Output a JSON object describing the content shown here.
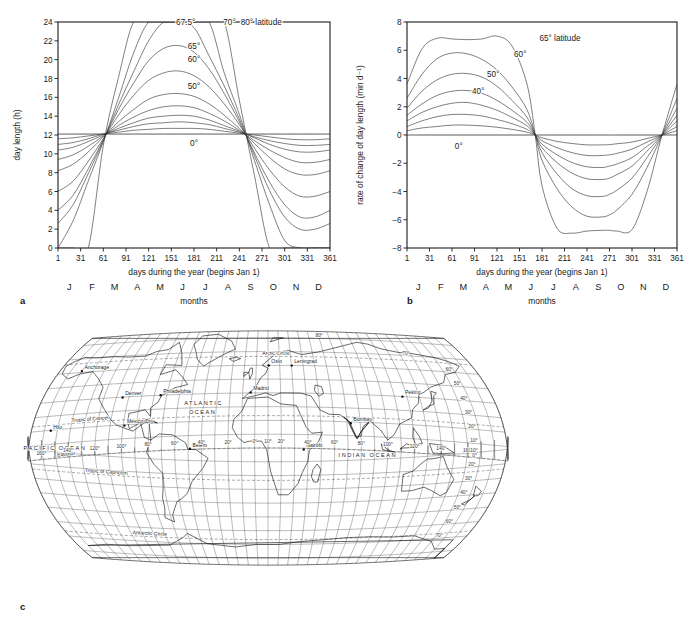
{
  "figure": {
    "panels": [
      {
        "letter": "a",
        "name": "day-length-chart"
      },
      {
        "letter": "b",
        "name": "rate-of-change-chart"
      },
      {
        "letter": "c",
        "name": "world-map"
      }
    ]
  },
  "panel_a": {
    "letter": "a",
    "ylabel": "day length (h)",
    "xlabel": "days during the year (begins Jan 1)",
    "months_label": "months",
    "yticks": [
      0,
      2,
      4,
      6,
      8,
      10,
      12,
      14,
      16,
      18,
      20,
      22,
      24
    ],
    "xticks": [
      1,
      31,
      61,
      91,
      121,
      151,
      181,
      211,
      241,
      271,
      301,
      331,
      361
    ],
    "months": [
      "J",
      "F",
      "M",
      "A",
      "M",
      "J",
      "J",
      "A",
      "S",
      "O",
      "N",
      "D"
    ],
    "curve_labels": [
      {
        "text": "67.5°",
        "x": 170,
        "y": 24
      },
      {
        "text": "70°",
        "x": 228,
        "y": 24
      },
      {
        "text": "80° latitude",
        "x": 270,
        "y": 24
      },
      {
        "text": "65°",
        "x": 181,
        "y": 21.5
      },
      {
        "text": "60°",
        "x": 181,
        "y": 20.1
      },
      {
        "text": "50°",
        "x": 181,
        "y": 17.2
      },
      {
        "text": "0°",
        "x": 181,
        "y": 11.15
      }
    ]
  },
  "panel_b": {
    "letter": "b",
    "ylabel": "rate of change of day length (min d⁻¹)",
    "xlabel": "days during the year (begins Jan 1)",
    "months_label": "months",
    "yticks": [
      -8,
      -6,
      -4,
      -2,
      0,
      2,
      4,
      6,
      8
    ],
    "xticks": [
      1,
      31,
      61,
      91,
      121,
      151,
      181,
      211,
      241,
      271,
      301,
      331,
      361
    ],
    "months": [
      "J",
      "F",
      "M",
      "A",
      "M",
      "J",
      "J",
      "A",
      "S",
      "O",
      "N",
      "D"
    ],
    "curve_labels": [
      {
        "text": "65° latitude",
        "x": 205,
        "y": 6.9
      },
      {
        "text": "60°",
        "x": 152,
        "y": 5.75
      },
      {
        "text": "50°",
        "x": 116,
        "y": 4.3
      },
      {
        "text": "40°",
        "x": 96,
        "y": 3.15
      },
      {
        "text": "0°",
        "x": 70,
        "y": -0.75
      }
    ]
  },
  "panel_c": {
    "letter": "c",
    "cities": [
      {
        "name": "Anchorage",
        "lon": -150,
        "lat": 61
      },
      {
        "name": "Denver",
        "lon": -105,
        "lat": 39.7
      },
      {
        "name": "Philadelphia",
        "lon": -75,
        "lat": 40
      },
      {
        "name": "Oslo",
        "lon": 10.7,
        "lat": 59.9
      },
      {
        "name": "Leningrad",
        "lon": 30.3,
        "lat": 59.9
      },
      {
        "name": "Madrid",
        "lon": -3.7,
        "lat": 40.4
      },
      {
        "name": "Peking",
        "lon": 116.4,
        "lat": 39.9
      },
      {
        "name": "Mexico City",
        "lon": -99,
        "lat": 19.4
      },
      {
        "name": "Hilo",
        "lon": -155,
        "lat": 19.7
      },
      {
        "name": "Bombay",
        "lon": 72.8,
        "lat": 19
      },
      {
        "name": "Belem",
        "lon": -48.5,
        "lat": -1.5
      },
      {
        "name": "Nairobi",
        "lon": 36.8,
        "lat": -1.3
      }
    ],
    "oceans": [
      {
        "name": "ATLANTIC",
        "lon": -40,
        "lat": 32
      },
      {
        "name": "OCEAN",
        "lon": -40,
        "lat": 25
      },
      {
        "name": "PACIFIC  OCEAN",
        "lon": -150,
        "lat": 6
      },
      {
        "name": "INDIAN OCEAN",
        "lon": 85,
        "lat": -8
      }
    ],
    "special_lines": [
      {
        "name": "Arctic Circle",
        "lat": 66.5
      },
      {
        "name": "Tropic of Cancer",
        "lat": 23.5
      },
      {
        "name": "Equator",
        "lat": 0
      },
      {
        "name": "Tropic of Capricorn",
        "lat": -23.5
      },
      {
        "name": "Antarctic Circle",
        "lat": -66.5
      }
    ],
    "longitude_labels": [
      "160°",
      "140°",
      "120°",
      "100°",
      "80°",
      "60°",
      "40°",
      "20°",
      "0°",
      "10°",
      "20°",
      "40°",
      "60°",
      "80°",
      "100°",
      "120°",
      "140°",
      "160°"
    ],
    "latitude_labels_right": [
      "80°",
      "70°",
      "60°",
      "50°",
      "40°",
      "30°",
      "20°",
      "10°",
      "0°",
      "10°",
      "20°",
      "30°",
      "40°",
      "50°",
      "60°",
      "70°"
    ]
  },
  "chart_data": [
    {
      "type": "line",
      "panel": "a",
      "title": "",
      "xlabel": "days during the year (begins Jan 1)",
      "ylabel": "day length (h)",
      "xlim": [
        1,
        361
      ],
      "ylim": [
        0,
        24
      ],
      "grid": false,
      "legend": "inline-curve-labels",
      "x": [
        1,
        21,
        41,
        61,
        81,
        101,
        121,
        141,
        161,
        181,
        201,
        221,
        241,
        261,
        281,
        301,
        321,
        341,
        361
      ],
      "series": [
        {
          "name": "0°",
          "values": [
            12.1,
            12.1,
            12.1,
            12.1,
            12.1,
            12.1,
            12.1,
            12.1,
            12.1,
            12.1,
            12.1,
            12.1,
            12.1,
            12.1,
            12.1,
            12.1,
            12.1,
            12.1,
            12.1
          ]
        },
        {
          "name": "10°",
          "values": [
            11.6,
            11.7,
            11.9,
            12.1,
            12.3,
            12.5,
            12.6,
            12.7,
            12.7,
            12.7,
            12.6,
            12.4,
            12.2,
            12.0,
            11.8,
            11.6,
            11.5,
            11.5,
            11.6
          ]
        },
        {
          "name": "20°",
          "values": [
            11.0,
            11.2,
            11.6,
            12.1,
            12.5,
            12.9,
            13.2,
            13.3,
            13.4,
            13.3,
            13.1,
            12.7,
            12.3,
            11.8,
            11.4,
            11.1,
            10.9,
            10.9,
            11.0
          ]
        },
        {
          "name": "30°",
          "values": [
            10.4,
            10.7,
            11.3,
            12.0,
            12.7,
            13.3,
            13.8,
            14.0,
            14.1,
            14.0,
            13.6,
            13.0,
            12.4,
            11.7,
            11.0,
            10.5,
            10.2,
            10.2,
            10.4
          ]
        },
        {
          "name": "40°",
          "values": [
            9.4,
            9.9,
            10.8,
            11.9,
            13.0,
            13.9,
            14.6,
            15.0,
            15.1,
            14.9,
            14.3,
            13.5,
            12.5,
            11.4,
            10.4,
            9.6,
            9.1,
            9.1,
            9.4
          ]
        },
        {
          "name": "50°",
          "values": [
            8.2,
            8.9,
            10.2,
            11.8,
            13.4,
            14.7,
            15.8,
            16.3,
            16.4,
            16.1,
            15.3,
            14.1,
            12.7,
            11.1,
            9.6,
            8.4,
            7.8,
            7.8,
            8.2
          ]
        },
        {
          "name": "60°",
          "values": [
            6.0,
            7.1,
            9.2,
            11.6,
            14.1,
            16.2,
            17.8,
            18.6,
            18.8,
            18.3,
            17.1,
            15.3,
            13.1,
            10.6,
            8.3,
            6.5,
            5.5,
            5.5,
            6.0
          ]
        },
        {
          "name": "65°",
          "values": [
            4.0,
            5.6,
            8.4,
            11.5,
            14.7,
            17.5,
            19.9,
            21.2,
            21.5,
            20.8,
            19.0,
            16.4,
            13.4,
            10.1,
            7.0,
            4.6,
            3.3,
            3.3,
            4.0
          ]
        },
        {
          "name": "67.5°",
          "values": [
            2.6,
            4.6,
            7.9,
            11.4,
            15.2,
            18.7,
            22.0,
            24.0,
            24.0,
            23.4,
            20.4,
            17.2,
            13.7,
            9.8,
            6.1,
            3.3,
            2.0,
            2.0,
            2.6
          ]
        },
        {
          "name": "70°",
          "values": [
            0.0,
            2.9,
            7.1,
            11.3,
            15.9,
            20.7,
            24.0,
            24.0,
            24.0,
            24.0,
            24.0,
            18.6,
            14.2,
            9.3,
            4.6,
            0.8,
            0.0,
            0.0,
            0.0
          ]
        },
        {
          "name": "80°",
          "values": [
            0.0,
            0.0,
            0.0,
            10.9,
            18.1,
            24.0,
            24.0,
            24.0,
            24.0,
            24.0,
            24.0,
            24.0,
            15.7,
            7.7,
            0.0,
            0.0,
            0.0,
            0.0,
            0.0
          ]
        }
      ]
    },
    {
      "type": "line",
      "panel": "b",
      "title": "",
      "xlabel": "days during the year (begins Jan 1)",
      "ylabel": "rate of change of day length (min d⁻¹)",
      "xlim": [
        1,
        361
      ],
      "ylim": [
        -8,
        8
      ],
      "grid": false,
      "legend": "inline-curve-labels",
      "x": [
        1,
        21,
        41,
        61,
        81,
        101,
        121,
        141,
        161,
        172,
        181,
        201,
        221,
        241,
        261,
        271,
        281,
        301,
        321,
        341,
        361
      ],
      "series": [
        {
          "name": "0°",
          "values": [
            0,
            0,
            0,
            0,
            0,
            0,
            0,
            0,
            0,
            0,
            0,
            0,
            0,
            0,
            0,
            0,
            0,
            0,
            0,
            0,
            0
          ]
        },
        {
          "name": "10°",
          "values": [
            0.3,
            0.5,
            0.6,
            0.7,
            0.7,
            0.65,
            0.55,
            0.4,
            0.2,
            0.0,
            -0.2,
            -0.45,
            -0.6,
            -0.7,
            -0.7,
            -0.68,
            -0.62,
            -0.5,
            -0.25,
            0.0,
            0.3
          ]
        },
        {
          "name": "20°",
          "values": [
            0.6,
            1.0,
            1.3,
            1.45,
            1.45,
            1.35,
            1.1,
            0.8,
            0.4,
            0.0,
            -0.4,
            -0.9,
            -1.25,
            -1.45,
            -1.45,
            -1.4,
            -1.3,
            -1.0,
            -0.5,
            0.0,
            0.6
          ]
        },
        {
          "name": "30°",
          "values": [
            1.0,
            1.6,
            2.0,
            2.25,
            2.3,
            2.1,
            1.75,
            1.25,
            0.65,
            0.0,
            -0.65,
            -1.4,
            -1.95,
            -2.25,
            -2.3,
            -2.2,
            -2.05,
            -1.6,
            -0.8,
            0.0,
            1.0
          ]
        },
        {
          "name": "40°",
          "values": [
            1.4,
            2.2,
            2.8,
            3.1,
            3.15,
            2.95,
            2.45,
            1.75,
            0.9,
            0.0,
            -0.9,
            -1.95,
            -2.7,
            -3.1,
            -3.15,
            -3.05,
            -2.8,
            -2.2,
            -1.15,
            0.0,
            1.4
          ]
        },
        {
          "name": "50°",
          "values": [
            1.9,
            3.1,
            3.9,
            4.3,
            4.35,
            4.1,
            3.45,
            2.45,
            1.25,
            0.0,
            -1.25,
            -2.75,
            -3.8,
            -4.3,
            -4.35,
            -4.2,
            -3.9,
            -3.05,
            -1.6,
            0.0,
            1.9
          ]
        },
        {
          "name": "60°",
          "values": [
            2.6,
            4.3,
            5.4,
            5.8,
            5.75,
            5.35,
            4.6,
            3.4,
            1.8,
            0.0,
            -1.8,
            -3.8,
            -5.1,
            -5.75,
            -5.8,
            -5.65,
            -5.3,
            -4.2,
            -2.3,
            0.0,
            2.6
          ]
        },
        {
          "name": "65°",
          "values": [
            3.6,
            6.1,
            6.85,
            6.8,
            6.75,
            6.8,
            7.0,
            6.3,
            3.6,
            0.0,
            -3.6,
            -6.6,
            -6.95,
            -6.8,
            -6.75,
            -6.75,
            -6.8,
            -6.7,
            -4.0,
            0.0,
            3.6
          ]
        }
      ]
    }
  ]
}
